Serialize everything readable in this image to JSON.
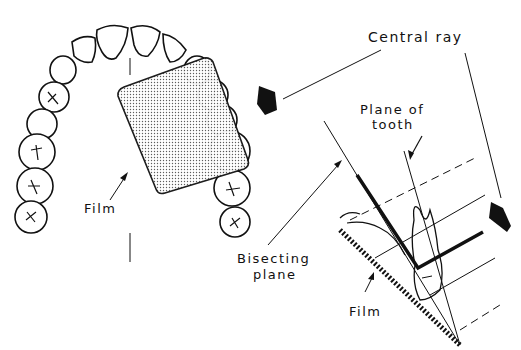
{
  "figure": {
    "type": "dental-radiography-diagram",
    "technique": "bisecting angle",
    "labels": {
      "central_ray": "Central ray",
      "plane_of_tooth_line1": "Plane of",
      "plane_of_tooth_line2": "tooth",
      "film_arch": "Film",
      "bisecting_plane_line1": "Bisecting",
      "bisecting_plane_line2": "plane",
      "film_side": "Film"
    },
    "colors": {
      "ink": "#111111",
      "film_fill": "#cfcfcf",
      "background": "#ffffff"
    }
  }
}
